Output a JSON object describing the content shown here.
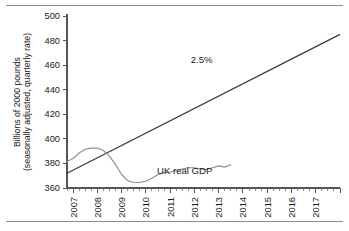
{
  "chart_data": {
    "type": "line",
    "title": "",
    "xlabel": "",
    "ylabel_line1": "Billions of 2000 pounds",
    "ylabel_line2": "(seasonally adjusted, quarterly rate)",
    "ylim": [
      360,
      500
    ],
    "yticks": [
      360,
      380,
      400,
      420,
      440,
      460,
      480,
      500
    ],
    "ytick_labels": [
      "360",
      "380",
      "400",
      "420",
      "440",
      "460",
      "480",
      "500"
    ],
    "xlim": [
      2006.75,
      2018.0
    ],
    "xticks": [
      2007,
      2008,
      2009,
      2010,
      2011,
      2012,
      2013,
      2014,
      2015,
      2016,
      2017
    ],
    "xtick_labels": [
      "2007",
      "2008",
      "2009",
      "2010",
      "2011",
      "2012",
      "2013",
      "2014",
      "2015",
      "2016",
      "2017"
    ],
    "minor_tick_interval_years": 0.25,
    "grid": false,
    "legend": "none",
    "annotations": [
      {
        "text": "2.5%",
        "x": 2012.3,
        "y": 462,
        "name": "trend-growth-annotation"
      },
      {
        "text": "UK real GDP",
        "x": 2011.6,
        "y": 371,
        "name": "gdp-series-annotation"
      }
    ],
    "series": [
      {
        "name": "2.5%",
        "label": "2.5% trend growth path",
        "color": "#3a3a3a",
        "style": "straight-line",
        "x": [
          2006.75,
          2018.0
        ],
        "values": [
          372.0,
          485.0
        ]
      },
      {
        "name": "UK real GDP",
        "label": "UK real GDP",
        "color": "#8e8e8e",
        "style": "line",
        "x": [
          2006.75,
          2007.0,
          2007.25,
          2007.5,
          2007.75,
          2008.0,
          2008.25,
          2008.5,
          2008.75,
          2009.0,
          2009.25,
          2009.5,
          2009.75,
          2010.0,
          2010.25,
          2010.5,
          2010.75,
          2011.0,
          2011.25,
          2011.5,
          2011.75,
          2012.0,
          2012.25,
          2012.5,
          2012.75,
          2013.0,
          2013.25,
          2013.5
        ],
        "values": [
          381.5,
          384.0,
          388.5,
          391.5,
          392.5,
          392.5,
          390.5,
          386.0,
          379.0,
          371.0,
          366.0,
          364.5,
          364.5,
          365.5,
          368.0,
          371.0,
          372.5,
          373.0,
          374.0,
          375.5,
          376.5,
          376.5,
          375.5,
          375.0,
          376.5,
          378.0,
          377.0,
          379.0
        ]
      }
    ]
  }
}
